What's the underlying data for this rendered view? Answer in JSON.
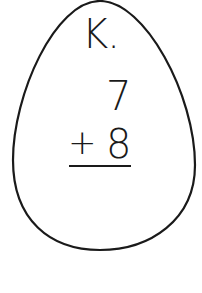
{
  "problem": {
    "label": "K.",
    "addend_top": "7",
    "operator": "+",
    "addend_bottom": "8"
  },
  "shape": {
    "type": "egg",
    "stroke_color": "#1a1a1a",
    "fill_color": "#ffffff"
  }
}
